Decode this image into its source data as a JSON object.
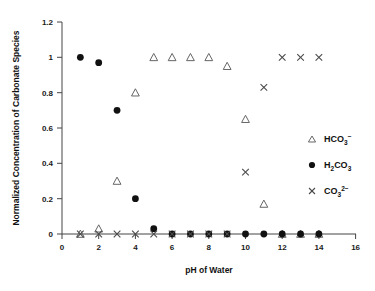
{
  "chart_data": {
    "type": "scatter",
    "title": "",
    "xlabel": "pH of Water",
    "ylabel": "Normalized Concentration of Carbonate Species",
    "xlim": [
      0,
      16
    ],
    "ylim": [
      0,
      1.2
    ],
    "xticks": [
      0,
      2,
      4,
      6,
      8,
      10,
      12,
      14,
      16
    ],
    "yticks": [
      0,
      0.2,
      0.4,
      0.6,
      0.8,
      1,
      1.2
    ],
    "xtick_labels": [
      "0",
      "2",
      "4",
      "6",
      "8",
      "10",
      "12",
      "14",
      "16"
    ],
    "ytick_labels": [
      "0",
      "0.2",
      "0.4",
      "0.6",
      "0.8",
      "1",
      "1.2"
    ],
    "grid": false,
    "legend_position": "right-middle",
    "x": [
      1,
      2,
      3,
      4,
      5,
      6,
      7,
      8,
      9,
      10,
      11,
      12,
      13,
      14
    ],
    "series": [
      {
        "name": "HCO3-",
        "legend_base": "HCO",
        "legend_sub": "3",
        "legend_sup": "−",
        "marker": "open-triangle",
        "color": "#666666",
        "values": [
          0.0,
          0.03,
          0.3,
          0.8,
          1.0,
          1.0,
          1.0,
          1.0,
          0.95,
          0.65,
          0.17,
          0.0,
          0.0,
          0.0
        ]
      },
      {
        "name": "H2CO3",
        "legend_base": "H",
        "legend_sub": "2",
        "legend_base2": "CO",
        "legend_sub2": "3",
        "legend_sup": "",
        "marker": "filled-circle",
        "color": "#111111",
        "values": [
          1.0,
          0.97,
          0.7,
          0.2,
          0.03,
          0.0,
          0.0,
          0.0,
          0.0,
          0.0,
          0.0,
          0.0,
          0.0,
          0.0
        ]
      },
      {
        "name": "CO3 2-",
        "legend_base": "CO",
        "legend_sub": "3",
        "legend_sup": "2−",
        "marker": "x",
        "color": "#4a4a4a",
        "values": [
          0.0,
          0.0,
          0.0,
          0.0,
          0.0,
          0.0,
          0.0,
          0.0,
          0.0,
          0.35,
          0.83,
          1.0,
          1.0,
          1.0
        ]
      }
    ]
  },
  "legend": {
    "items": [
      {
        "label": "HCO3-",
        "marker": "open-triangle"
      },
      {
        "label": "H2CO3",
        "marker": "filled-circle"
      },
      {
        "label": "CO3 2-",
        "marker": "x"
      }
    ]
  }
}
